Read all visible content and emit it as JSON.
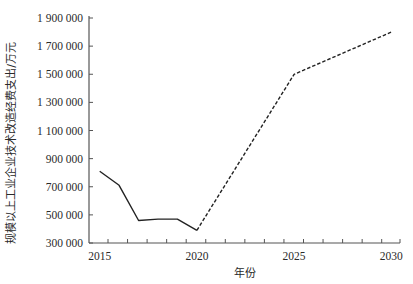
{
  "chart_data": {
    "type": "line",
    "title": "",
    "xlabel": "年份",
    "ylabel": "规模以上工业企业技术改造经费支出/万元",
    "x_ticks": [
      "2015",
      "2020",
      "2025",
      "2030"
    ],
    "y_ticks": [
      "300 000",
      "500 000",
      "700 000",
      "900 000",
      "1 100 000",
      "1 300 000",
      "1 500 000",
      "1 700 000",
      "1 900 000"
    ],
    "xlim": [
      2014.45,
      2030.45
    ],
    "ylim": [
      300000,
      1900000
    ],
    "grid": false,
    "legend": null,
    "series": [
      {
        "name": "历史值",
        "style": "solid",
        "x": [
          2015,
          2016,
          2017,
          2018,
          2019,
          2020
        ],
        "values": [
          810000,
          710000,
          460000,
          470000,
          470000,
          390000
        ]
      },
      {
        "name": "预测值",
        "style": "dashed",
        "x": [
          2020,
          2025,
          2030
        ],
        "values": [
          390000,
          1500000,
          1800000
        ]
      }
    ]
  },
  "colors": {
    "axis": "#555555",
    "line": "#222222",
    "text": "#2a2a2a"
  }
}
